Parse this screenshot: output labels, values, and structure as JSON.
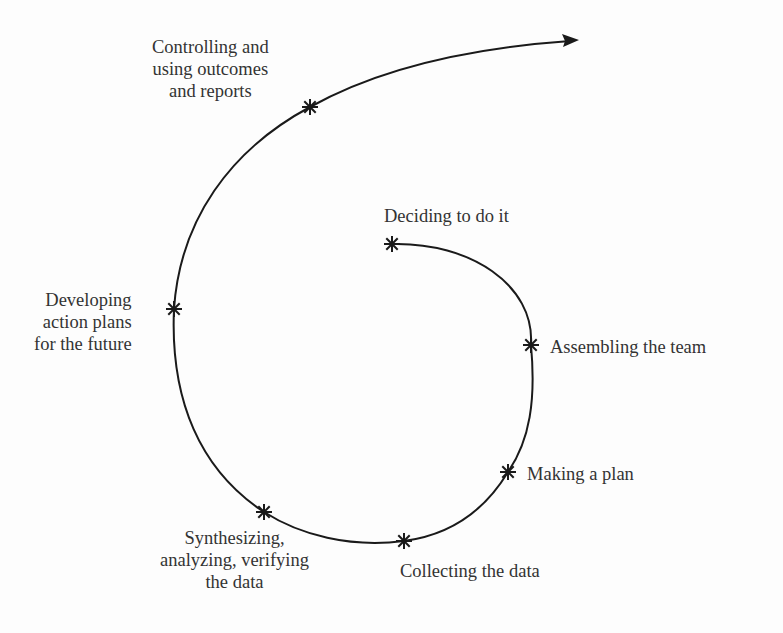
{
  "diagram": {
    "type": "spiral-process",
    "stroke_color": "#1a1a1a",
    "text_color": "#333333",
    "background": "#fdfdfd",
    "path": "M 392 244 C 470 242, 535 285, 531 345 C 536 400, 530 440, 508 472 C 485 510, 450 535, 404 541 C 350 548, 300 535, 264 512 C 200 470, 170 400, 174 309 C 180 220, 230 150, 310 107 C 380 68, 470 48, 570 41",
    "arrow_head": {
      "tip": [
        579,
        40
      ],
      "direction": "right"
    },
    "steps": [
      {
        "id": "deciding",
        "order": 1,
        "marker": [
          392,
          244
        ],
        "lines": [
          "Deciding to do it"
        ],
        "label_pos": {
          "left": 384,
          "top": 205
        },
        "align": "left"
      },
      {
        "id": "assembling",
        "order": 2,
        "marker": [
          531,
          345
        ],
        "lines": [
          "Assembling the team"
        ],
        "label_pos": {
          "left": 550,
          "top": 336
        },
        "align": "left"
      },
      {
        "id": "making-plan",
        "order": 3,
        "marker": [
          508,
          472
        ],
        "lines": [
          "Making a plan"
        ],
        "label_pos": {
          "left": 527,
          "top": 463
        },
        "align": "left"
      },
      {
        "id": "collecting",
        "order": 4,
        "marker": [
          404,
          541
        ],
        "lines": [
          "Collecting the data"
        ],
        "label_pos": {
          "left": 400,
          "top": 560
        },
        "align": "left"
      },
      {
        "id": "synthesizing",
        "order": 5,
        "marker": [
          264,
          512
        ],
        "lines": [
          "Synthesizing,",
          "analyzing, verifying",
          "the data"
        ],
        "label_pos": {
          "left": 160,
          "top": 527
        },
        "align": "center"
      },
      {
        "id": "developing",
        "order": 6,
        "marker": [
          174,
          309
        ],
        "lines": [
          "Developing",
          "action plans",
          "for the future"
        ],
        "label_pos": {
          "left": 34,
          "top": 289
        },
        "align": "right"
      },
      {
        "id": "controlling",
        "order": 7,
        "marker": [
          310,
          107
        ],
        "lines": [
          "Controlling and",
          "using outcomes",
          "and reports"
        ],
        "label_pos": {
          "left": 152,
          "top": 36
        },
        "align": "center"
      }
    ]
  }
}
